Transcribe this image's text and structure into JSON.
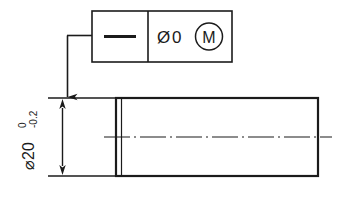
{
  "drawing": {
    "title": "Straightness tolerance at MMC on cylindrical feature",
    "background_color": "#ffffff",
    "line_color": "#1b1b1b",
    "feature_control_frame": {
      "name": "feature-control-frame",
      "geometric_characteristic_symbol": "straightness",
      "geometric_characteristic_glyph": "—",
      "tolerance_zone_shape_symbol": "⌀",
      "tolerance_value": "0",
      "tolerance_text": "⌀ 0",
      "material_condition_modifier": "M",
      "material_condition_meaning": "MMC",
      "compartments": 2
    },
    "dimension": {
      "name": "diameter-dimension",
      "diameter_symbol": "⌀",
      "nominal_value": "20",
      "nominal_text": "⌀20",
      "upper_tolerance": "0",
      "lower_tolerance": "-0.2",
      "orientation": "vertical",
      "arrow_style": "filled-closed"
    },
    "part": {
      "name": "cylindrical-part-side-view",
      "outline_shape": "rectangle",
      "centerline_style": "dash-dot"
    },
    "leader": {
      "name": "leader-line",
      "style": "horizontal-then-vertical-with-arrow"
    }
  }
}
